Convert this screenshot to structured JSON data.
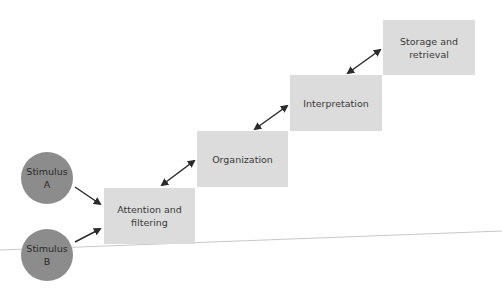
{
  "diagram": {
    "stimuli": [
      {
        "label": "Stimulus\nA"
      },
      {
        "label": "Stimulus\nB"
      }
    ],
    "stages": [
      {
        "label": "Attention and\nfiltering"
      },
      {
        "label": "Organization"
      },
      {
        "label": "Interpretation"
      },
      {
        "label": "Storage and\nretrieval"
      }
    ],
    "colors": {
      "stage_fill": "#dcdcdc",
      "stimulus_fill": "#8c8c8c",
      "arrow": "#2b2b2b"
    }
  }
}
